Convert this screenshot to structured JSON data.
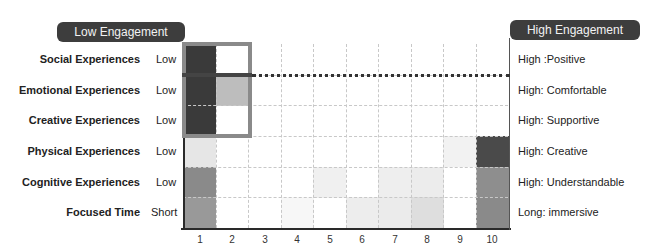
{
  "chart_data": {
    "type": "heatmap",
    "title": "",
    "left_header": "Low Engagement",
    "right_header": "High Engagement",
    "x": [
      1,
      2,
      3,
      4,
      5,
      6,
      7,
      8,
      9,
      10
    ],
    "xlabel": "",
    "ylabel": "",
    "rows": [
      {
        "name": "Social Experiences",
        "low_label": "Low",
        "high_label": "High :Positive",
        "values": [
          "#3a3a3a",
          "#ffffff",
          "#ffffff",
          "#ffffff",
          "#ffffff",
          "#ffffff",
          "#ffffff",
          "#ffffff",
          "#ffffff",
          "#ffffff"
        ]
      },
      {
        "name": "Emotional Experiences",
        "low_label": "Low",
        "high_label": "High: Comfortable",
        "values": [
          "#3a3a3a",
          "#bdbdbd",
          "#ffffff",
          "#ffffff",
          "#ffffff",
          "#ffffff",
          "#ffffff",
          "#ffffff",
          "#ffffff",
          "#ffffff"
        ]
      },
      {
        "name": "Creative Experiences",
        "low_label": "Low",
        "high_label": "High: Supportive",
        "values": [
          "#3a3a3a",
          "#ffffff",
          "#ffffff",
          "#ffffff",
          "#ffffff",
          "#ffffff",
          "#ffffff",
          "#ffffff",
          "#ffffff",
          "#ffffff"
        ]
      },
      {
        "name": "Physical Experiences",
        "low_label": "Low",
        "high_label": "High: Creative",
        "values": [
          "#e6e6e6",
          "#ffffff",
          "#ffffff",
          "#ffffff",
          "#ffffff",
          "#ffffff",
          "#ffffff",
          "#ffffff",
          "#f2f2f2",
          "#4a4a4a"
        ]
      },
      {
        "name": "Cognitive Experiences",
        "low_label": "Low",
        "high_label": "High: Understandable",
        "values": [
          "#8a8a8a",
          "#ffffff",
          "#ffffff",
          "#ffffff",
          "#f0f0f0",
          "#ffffff",
          "#eeeeee",
          "#ececec",
          "#ffffff",
          "#8e8e8e"
        ]
      },
      {
        "name": "Focused Time",
        "low_label": "Short",
        "high_label": "Long: immersive",
        "values": [
          "#999999",
          "#ffffff",
          "#ffffff",
          "#f7f7f7",
          "#ffffff",
          "#ededed",
          "#ebebeb",
          "#dedede",
          "#ffffff",
          "#8a8a8a"
        ]
      }
    ],
    "annotations": [
      {
        "type": "box",
        "columns": [
          1,
          2
        ],
        "rows": [
          1,
          3
        ],
        "color": "#8a8a8a"
      },
      {
        "type": "dotted-line",
        "between_rows": [
          1,
          2
        ],
        "from_column": 3,
        "to_column": 10
      }
    ],
    "grid": true,
    "legend": "none"
  },
  "headers": {
    "left": "Low Engagement",
    "right": "High Engagement"
  },
  "rows": [
    {
      "name": "Social Experiences",
      "low": "Low",
      "high": "High :Positive"
    },
    {
      "name": "Emotional Experiences",
      "low": "Low",
      "high": "High: Comfortable"
    },
    {
      "name": "Creative Experiences",
      "low": "Low",
      "high": "High: Supportive"
    },
    {
      "name": "Physical Experiences",
      "low": "Low",
      "high": "High: Creative"
    },
    {
      "name": "Cognitive Experiences",
      "low": "Low",
      "high": "High: Understandable"
    },
    {
      "name": "Focused Time",
      "low": "Short",
      "high": "Long: immersive"
    }
  ],
  "x_ticks": [
    "1",
    "2",
    "3",
    "4",
    "5",
    "6",
    "7",
    "8",
    "9",
    "10"
  ]
}
